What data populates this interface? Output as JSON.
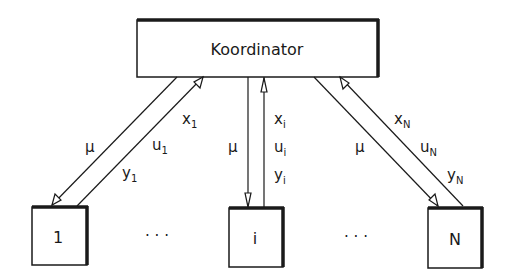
{
  "coordinator": {
    "label": "Koordinator"
  },
  "subsystems": [
    {
      "label": "1",
      "down_signal": "μ",
      "up_signals": [
        {
          "base": "x",
          "sub": "1"
        },
        {
          "base": "u",
          "sub": "1"
        },
        {
          "base": "y",
          "sub": "1"
        }
      ]
    },
    {
      "label": "i",
      "down_signal": "μ",
      "up_signals": [
        {
          "base": "x",
          "sub": "i"
        },
        {
          "base": "u",
          "sub": "i"
        },
        {
          "base": "y",
          "sub": "i"
        }
      ]
    },
    {
      "label": "N",
      "down_signal": "μ",
      "up_signals": [
        {
          "base": "x",
          "sub": "N"
        },
        {
          "base": "u",
          "sub": "N"
        },
        {
          "base": "y",
          "sub": "N"
        }
      ]
    }
  ],
  "ellipsis": "· · ·",
  "colors": {
    "stroke": "#1a1a1a",
    "background": "#ffffff"
  }
}
